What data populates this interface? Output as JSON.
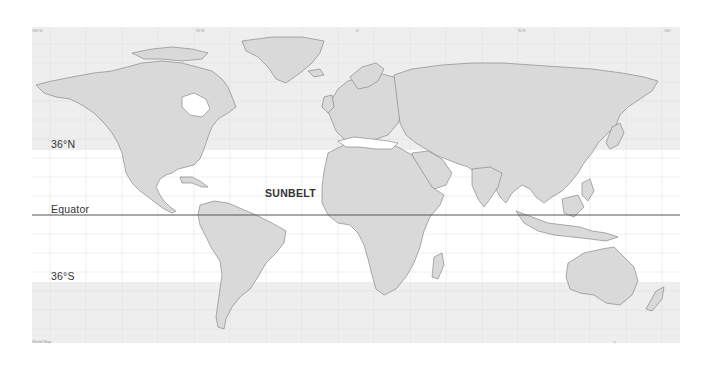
{
  "map": {
    "title": "World Map",
    "region_label": "SUNBELT",
    "lines": {
      "north": "36°N",
      "equator": "Equator",
      "south": "36°S"
    },
    "lon_ticks": [
      "180°W",
      "170°W",
      "160°W",
      "150°W",
      "140°W",
      "130°W",
      "120°W",
      "110°W",
      "100°W",
      "90°W",
      "80°W",
      "70°W",
      "60°W",
      "50°W",
      "40°W",
      "30°W",
      "20°W",
      "10°W",
      "0°",
      "10°E",
      "20°E",
      "30°E",
      "40°E",
      "50°E",
      "60°E",
      "70°E",
      "80°E",
      "90°E",
      "100°E",
      "110°E",
      "120°E",
      "130°E",
      "140°E",
      "150°E",
      "160°E",
      "170°E",
      "180°"
    ],
    "lat_ticks": [
      "80°N",
      "70°N",
      "60°N",
      "50°N",
      "40°N",
      "30°N",
      "20°N",
      "10°N",
      "0°",
      "10°S",
      "20°S",
      "30°S",
      "40°S",
      "50°S",
      "60°S"
    ],
    "caption_left": "World Map",
    "caption_right": "©",
    "colors": {
      "land": "#d9d9d9",
      "border": "#7a7a7a",
      "band": "#eeeeee",
      "ocean": "#ffffff",
      "equator_line": "#555555",
      "grid": "#d6d6d6"
    }
  }
}
